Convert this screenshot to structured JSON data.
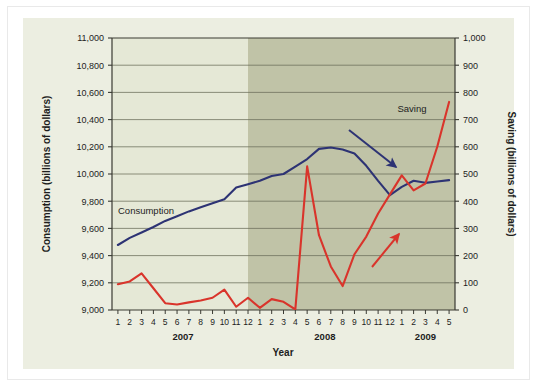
{
  "chart_data": {
    "type": "line",
    "title": "",
    "xlabel": "Year",
    "grid": true,
    "legend_position": "inline-labels",
    "x": [
      "2007-1",
      "2007-2",
      "2007-3",
      "2007-4",
      "2007-5",
      "2007-6",
      "2007-7",
      "2007-8",
      "2007-9",
      "2007-10",
      "2007-11",
      "2007-12",
      "2008-1",
      "2008-2",
      "2008-3",
      "2008-4",
      "2008-5",
      "2008-6",
      "2008-7",
      "2008-8",
      "2008-9",
      "2008-10",
      "2008-11",
      "2008-12",
      "2009-1",
      "2009-2",
      "2009-3",
      "2009-4",
      "2009-5"
    ],
    "x_tick_labels": [
      "1",
      "2",
      "3",
      "4",
      "5",
      "6",
      "7",
      "8",
      "9",
      "10",
      "11",
      "12",
      "1",
      "2",
      "3",
      "4",
      "5",
      "6",
      "7",
      "8",
      "9",
      "10",
      "11",
      "12",
      "1",
      "2",
      "3",
      "4",
      "5"
    ],
    "year_groups": [
      {
        "label": "2007",
        "start_index": 0,
        "end_index": 11
      },
      {
        "label": "2008",
        "start_index": 12,
        "end_index": 23
      },
      {
        "label": "2009",
        "start_index": 24,
        "end_index": 28
      }
    ],
    "left_axis": {
      "label": "Consumption (billions of dollars)",
      "ylim": [
        9000,
        11000
      ],
      "ticks": [
        9000,
        9200,
        9400,
        9600,
        9800,
        10000,
        10200,
        10400,
        10600,
        10800,
        11000
      ],
      "tick_labels": [
        "9,000",
        "9,200",
        "9,400",
        "9,600",
        "9,800",
        "10,000",
        "10,200",
        "10,400",
        "10,600",
        "10,800",
        "11,000"
      ]
    },
    "right_axis": {
      "label": "Saving (billions of dollars)",
      "ylim": [
        0,
        1000
      ],
      "ticks": [
        0,
        100,
        200,
        300,
        400,
        500,
        600,
        700,
        800,
        900,
        1000
      ],
      "tick_labels": [
        "0",
        "100",
        "200",
        "300",
        "400",
        "500",
        "600",
        "700",
        "800",
        "900",
        "1,000"
      ]
    },
    "series": [
      {
        "name": "Consumption",
        "axis": "left",
        "color": "#2d3374",
        "values": [
          9478,
          9530,
          9570,
          9610,
          9655,
          9690,
          9725,
          9755,
          9785,
          9815,
          9900,
          9925,
          9950,
          9985,
          10000,
          10055,
          10110,
          10185,
          10195,
          10180,
          10150,
          10060,
          9950,
          9845,
          9905,
          9950,
          9935,
          9945,
          9955
        ]
      },
      {
        "name": "Saving",
        "axis": "right",
        "color": "#d9342b",
        "values": [
          95,
          105,
          135,
          80,
          25,
          20,
          28,
          35,
          45,
          75,
          12,
          45,
          8,
          40,
          30,
          2,
          528,
          275,
          160,
          88,
          205,
          270,
          355,
          425,
          495,
          440,
          465,
          600,
          765
        ]
      }
    ],
    "shaded_region": {
      "label": "Recession shading",
      "start_index": 11,
      "end_index": 28,
      "color": "#b2b494"
    },
    "annotations": [
      {
        "name": "consumption-label",
        "text": "Consumption",
        "color": "#1d1d1d",
        "x_index": 0.9,
        "y_value": 9760,
        "axis": "left"
      },
      {
        "name": "saving-label",
        "text": "Saving",
        "color": "#1d1d1d",
        "x_index": 23.6,
        "y_value": 755,
        "axis": "right"
      },
      {
        "name": "consumption-arrow",
        "text": "",
        "color": "#2d3374"
      },
      {
        "name": "saving-arrow",
        "text": "",
        "color": "#d9342b"
      }
    ]
  },
  "figure": {
    "background": "#eceee1",
    "plot_background_left": "#e5e8d6",
    "plot_background_right": "#b9bb9c",
    "grid_color": "#6d6f5c",
    "axis_color": "#3a3a33"
  }
}
